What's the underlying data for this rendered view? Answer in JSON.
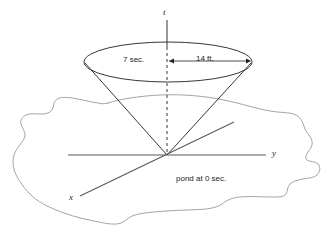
{
  "figure": {
    "type": "geometry-diagram",
    "axes": {
      "vertical_label": "t",
      "right_label": "y",
      "left_label": "x"
    },
    "annotations": {
      "time_label": "7 sec.",
      "radius_label": "14 ft.",
      "pond_label": "pond at 0 sec."
    },
    "colors": {
      "stroke": "#231f20",
      "pond_stroke": "#9a9a9a",
      "background": "#ffffff"
    }
  }
}
